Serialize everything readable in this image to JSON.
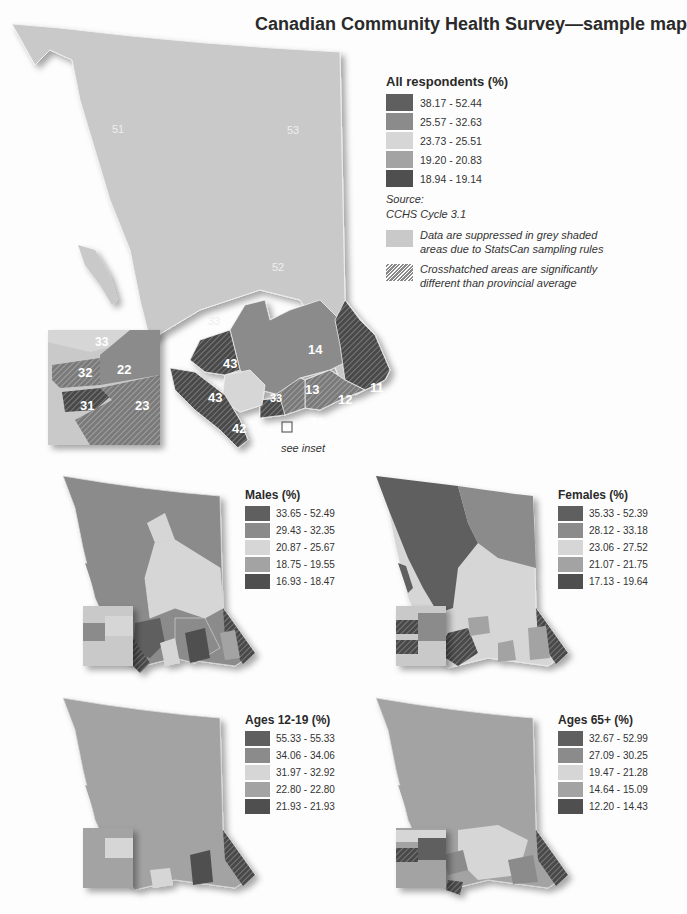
{
  "title": "Canadian Community Health Survey—sample map",
  "colors": {
    "class1": "#5f5f5f",
    "class2": "#8b8b8b",
    "class3": "#d6d6d6",
    "class4": "#a3a3a3",
    "class5": "#4f4f4f",
    "suppressed": "#c9c9c9",
    "background": "#fdfdfd"
  },
  "main_map": {
    "legend": {
      "title": "All respondents (%)",
      "classes": [
        "38.17 - 52.44",
        "25.57 - 32.63",
        "23.73 - 25.51",
        "19.20 - 20.83",
        "18.94 - 19.14"
      ]
    },
    "source_label": "Source:",
    "source_value": "CCHS Cycle 3.1",
    "suppressed_note": "Data are suppressed in grey shaded areas due to StatsCan sampling rules",
    "suppressed_note_line1": "Data are suppressed in grey shaded",
    "suppressed_note_line2": "areas due to StatsCan sampling rules",
    "crosshatch_note_line1": "Crosshatched areas are significantly",
    "crosshatch_note_line2": "different than provincial average",
    "region_labels": [
      "51",
      "53",
      "52",
      "33",
      "14",
      "43",
      "43",
      "13",
      "12",
      "11",
      "33",
      "21",
      "42",
      "41"
    ],
    "inset_labels": [
      "33",
      "32",
      "22",
      "31",
      "23"
    ],
    "see_inset": "see inset"
  },
  "small_maps": [
    {
      "id": "males",
      "legend_title": "Males (%)",
      "classes": [
        "33.65 - 52.49",
        "29.43 - 32.35",
        "20.87 - 25.67",
        "18.75 - 19.55",
        "16.93 - 18.47"
      ]
    },
    {
      "id": "females",
      "legend_title": "Females (%)",
      "classes": [
        "35.33 - 52.39",
        "28.12 - 33.18",
        "23.06 - 27.52",
        "21.07 - 21.75",
        "17.13 - 19.64"
      ]
    },
    {
      "id": "ages-12-19",
      "legend_title": "Ages 12-19 (%)",
      "classes": [
        "55.33 - 55.33",
        "34.06 - 34.06",
        "31.97 - 32.92",
        "22.80 - 22.80",
        "21.93 - 21.93"
      ]
    },
    {
      "id": "ages-65-plus",
      "legend_title": "Ages 65+ (%)",
      "classes": [
        "32.67 - 52.99",
        "27.09 - 30.25",
        "19.47 - 21.28",
        "14.64 - 15.09",
        "12.20 - 14.43"
      ]
    }
  ]
}
